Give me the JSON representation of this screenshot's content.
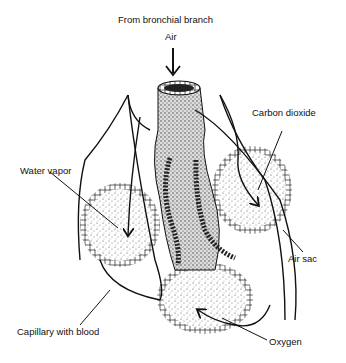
{
  "title": "From bronchial branch",
  "labels": {
    "source": "From bronchial branch",
    "air": "Air",
    "carbon_dioxide": "Carbon dioxide",
    "water_vapor": "Water vapor",
    "air_sac": "Air sac",
    "capillary": "Capillary with blood",
    "oxygen": "Oxygen"
  },
  "colors": {
    "ink": "#111111",
    "stipple": "#555555",
    "background": "#ffffff"
  }
}
